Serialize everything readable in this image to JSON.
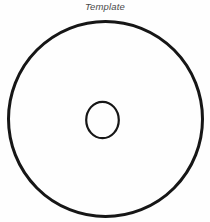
{
  "figure": {
    "caption": "Template",
    "caption_style": "italic",
    "background_color": "#fefefe",
    "width": 210,
    "height": 222
  },
  "chart_data": {
    "type": "diagram",
    "title": "Template",
    "subtitle": "",
    "units": "pixels",
    "stroke_color": "#161616",
    "fill_color": "none",
    "shapes": [
      {
        "name": "outer-circle",
        "type": "circle",
        "cx": 105.5,
        "cy": 119.0,
        "r": 97.5,
        "stroke_width": 3.0,
        "fill": "none"
      },
      {
        "name": "inner-circle",
        "type": "circle",
        "cx": 102.5,
        "cy": 120.0,
        "r": 16.5,
        "stroke_width": 2.2,
        "fill": "none"
      }
    ],
    "annotations": [
      {
        "name": "caption-label",
        "text": "Template",
        "x": 105,
        "y": 10,
        "anchor": "middle",
        "style": "italic",
        "color": "#4a4a4a"
      }
    ],
    "grid": false,
    "legend": false,
    "axes": false
  }
}
